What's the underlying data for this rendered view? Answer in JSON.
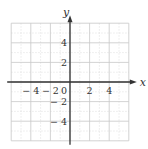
{
  "diagram": {
    "type": "coordinate-grid",
    "x_axis": {
      "label": "x",
      "min": -6,
      "max": 6,
      "tick_labels": [
        "-4",
        "-2",
        "0",
        "2",
        "4"
      ],
      "tick_values": [
        -4,
        -2,
        0,
        2,
        4
      ]
    },
    "y_axis": {
      "label": "y",
      "min": -6,
      "max": 6,
      "tick_labels": [
        "4",
        "2",
        "-2",
        "-4"
      ],
      "tick_values": [
        4,
        2,
        -2,
        -4
      ]
    },
    "grid": {
      "major_step": 2,
      "minor_step": 1,
      "major_color": "#c8c8c8",
      "minor_color": "#dcdcdc",
      "axis_color": "#333333"
    }
  }
}
